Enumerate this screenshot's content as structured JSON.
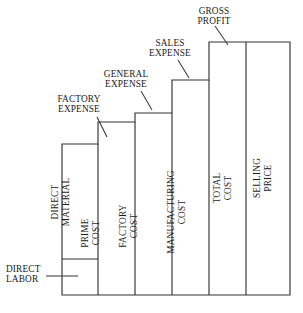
{
  "diagram": {
    "type": "staircase-cost-diagram",
    "baseline_y": 295,
    "stroke_color": "#333333",
    "background_color": "#ffffff",
    "columns": [
      {
        "id": "direct-material",
        "label": "DIRECT\nMATERIAL",
        "x": 62,
        "right": 98,
        "top": 144,
        "segments": [
          {
            "id": "direct-material-segment",
            "label": "DIRECT\nMATERIAL",
            "top": 144,
            "bottom": 259
          },
          {
            "id": "direct-labor-segment",
            "label": "",
            "top": 259,
            "bottom": 295
          }
        ]
      },
      {
        "id": "prime-cost",
        "label": "PRIME\nCOST",
        "x": 98,
        "right": 135,
        "top": 122,
        "segments": []
      },
      {
        "id": "factory-cost",
        "label": "FACTORY\nCOST",
        "x": 135,
        "right": 172,
        "top": 113,
        "segments": []
      },
      {
        "id": "manufacturing-cost",
        "label": "MANUFACTURING\nCOST",
        "x": 172,
        "right": 209,
        "top": 80,
        "segments": []
      },
      {
        "id": "total-cost",
        "label": "TOTAL\nCOST",
        "x": 209,
        "right": 246,
        "top": 42,
        "segments": []
      },
      {
        "id": "selling-price",
        "label": "SELLING\nPRICE",
        "x": 246,
        "right": 290,
        "top": 42,
        "segments": []
      }
    ],
    "callouts": [
      {
        "id": "direct-labor",
        "label": "DIRECT\nLABOR",
        "points_to": "direct-labor-segment"
      },
      {
        "id": "factory-expense",
        "label": "FACTORY\nEXPENSE",
        "points_to": "prime-cost-increment"
      },
      {
        "id": "general-expense",
        "label": "GENERAL\nEXPENSE",
        "points_to": "factory-cost-increment"
      },
      {
        "id": "sales-expense",
        "label": "SALES\nEXPENSE",
        "points_to": "manufacturing-cost-increment"
      },
      {
        "id": "gross-profit",
        "label": "GROSS\nPROFIT",
        "points_to": "total-cost-increment"
      }
    ]
  }
}
